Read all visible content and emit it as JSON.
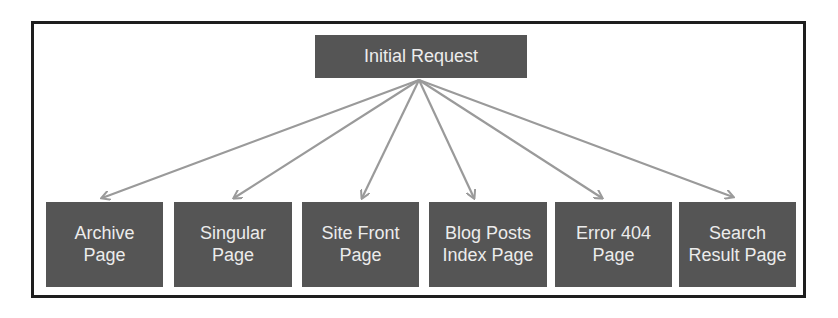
{
  "diagram": {
    "type": "tree",
    "colors": {
      "frame_border": "#1e1e1e",
      "node_fill": "#555555",
      "node_text": "#ececec",
      "edge": "#9a9a9a",
      "background": "#ffffff"
    },
    "root": {
      "id": "initial-request",
      "label": "Initial Request"
    },
    "children": [
      {
        "id": "archive-page",
        "label": "Archive\nPage"
      },
      {
        "id": "singular-page",
        "label": "Singular\nPage"
      },
      {
        "id": "site-front-page",
        "label": "Site Front\nPage"
      },
      {
        "id": "blog-posts-index-page",
        "label": "Blog Posts\nIndex Page"
      },
      {
        "id": "error-404-page",
        "label": "Error 404\nPage"
      },
      {
        "id": "search-result-page",
        "label": "Search\nResult Page"
      }
    ],
    "edges": [
      {
        "from": "initial-request",
        "to": "archive-page"
      },
      {
        "from": "initial-request",
        "to": "singular-page"
      },
      {
        "from": "initial-request",
        "to": "site-front-page"
      },
      {
        "from": "initial-request",
        "to": "blog-posts-index-page"
      },
      {
        "from": "initial-request",
        "to": "error-404-page"
      },
      {
        "from": "initial-request",
        "to": "search-result-page"
      }
    ]
  }
}
